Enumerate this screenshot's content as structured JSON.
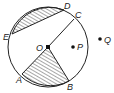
{
  "diagram": {
    "type": "circle-geometry",
    "circle": {
      "center_label": "O",
      "cx": 48,
      "cy": 47,
      "r": 40
    },
    "points": {
      "O": {
        "label": "O",
        "x": 48,
        "y": 47
      },
      "A": {
        "label": "A",
        "x": 22,
        "y": 74
      },
      "B": {
        "label": "B",
        "x": 69,
        "y": 81
      },
      "C": {
        "label": "C",
        "x": 74,
        "y": 19
      },
      "D": {
        "label": "D",
        "x": 64,
        "y": 10
      },
      "E": {
        "label": "E",
        "x": 12,
        "y": 34
      },
      "P": {
        "label": "P",
        "x": 73,
        "y": 47
      },
      "Q": {
        "label": "Q",
        "x": 100,
        "y": 39
      }
    },
    "shaded_regions": [
      "segment ED",
      "sector AOB"
    ],
    "colors": {
      "line": "#222222",
      "background": "#ffffff"
    }
  }
}
